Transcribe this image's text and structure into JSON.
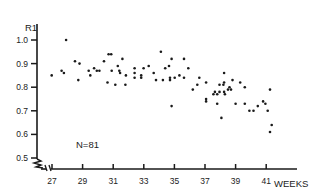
{
  "chart_data": {
    "type": "scatter",
    "title": "",
    "xlabel": "WEEKS",
    "ylabel": "R1",
    "annotation": "N=81",
    "xlim": [
      26.5,
      42.5
    ],
    "ylim": [
      0.5,
      1.0
    ],
    "x_ticks": [
      27,
      29,
      31,
      33,
      35,
      37,
      39,
      41
    ],
    "y_ticks": [
      0.5,
      0.6,
      0.7,
      0.8,
      0.9,
      1.0
    ],
    "y_tick_labels": [
      "0.5",
      "0.6",
      "0.7",
      "0.8",
      "0.9",
      "1.0"
    ],
    "grid": false,
    "axis_break": true,
    "colors": {
      "ink": "#1a1a1a",
      "background": "#ffffff"
    },
    "points": [
      [
        26.98,
        0.85
      ],
      [
        27.63,
        0.87
      ],
      [
        27.78,
        0.86
      ],
      [
        27.92,
        1.0
      ],
      [
        28.5,
        0.91
      ],
      [
        28.8,
        0.9
      ],
      [
        28.72,
        0.83
      ],
      [
        29.4,
        0.87
      ],
      [
        29.5,
        0.85
      ],
      [
        29.75,
        0.88
      ],
      [
        29.93,
        0.87
      ],
      [
        30.1,
        0.87
      ],
      [
        30.4,
        0.91
      ],
      [
        30.63,
        0.82
      ],
      [
        30.7,
        0.94
      ],
      [
        30.87,
        0.94
      ],
      [
        30.9,
        0.87
      ],
      [
        31.14,
        0.81
      ],
      [
        31.3,
        0.89
      ],
      [
        31.4,
        0.87
      ],
      [
        31.45,
        0.86
      ],
      [
        31.6,
        0.92
      ],
      [
        31.8,
        0.81
      ],
      [
        31.83,
        0.85
      ],
      [
        32.4,
        0.88
      ],
      [
        32.4,
        0.86
      ],
      [
        32.4,
        0.84
      ],
      [
        32.83,
        0.85
      ],
      [
        32.83,
        0.84
      ],
      [
        32.99,
        0.88
      ],
      [
        33.32,
        0.89
      ],
      [
        33.65,
        0.86
      ],
      [
        33.8,
        0.83
      ],
      [
        34.12,
        0.95
      ],
      [
        34.25,
        0.83
      ],
      [
        34.4,
        0.88
      ],
      [
        34.65,
        0.89
      ],
      [
        34.71,
        0.84
      ],
      [
        34.71,
        0.83
      ],
      [
        34.82,
        0.92
      ],
      [
        34.82,
        0.72
      ],
      [
        35.02,
        0.84
      ],
      [
        35.33,
        0.85
      ],
      [
        35.63,
        0.92
      ],
      [
        35.63,
        0.84
      ],
      [
        35.91,
        0.88
      ],
      [
        36.2,
        0.79
      ],
      [
        36.5,
        0.81
      ],
      [
        36.63,
        0.84
      ],
      [
        37.07,
        0.82
      ],
      [
        37.07,
        0.75
      ],
      [
        37.07,
        0.74
      ],
      [
        37.55,
        0.77
      ],
      [
        37.65,
        0.78
      ],
      [
        37.8,
        0.77
      ],
      [
        37.8,
        0.73
      ],
      [
        37.95,
        0.81
      ],
      [
        37.95,
        0.78
      ],
      [
        38.07,
        0.67
      ],
      [
        38.2,
        0.81
      ],
      [
        38.25,
        0.86
      ],
      [
        38.25,
        0.82
      ],
      [
        38.25,
        0.78
      ],
      [
        38.3,
        0.77
      ],
      [
        38.5,
        0.79
      ],
      [
        38.6,
        0.8
      ],
      [
        38.7,
        0.79
      ],
      [
        38.8,
        0.83
      ],
      [
        39.0,
        0.73
      ],
      [
        39.3,
        0.82
      ],
      [
        39.6,
        0.8
      ],
      [
        39.6,
        0.73
      ],
      [
        39.9,
        0.7
      ],
      [
        40.17,
        0.7
      ],
      [
        40.45,
        0.72
      ],
      [
        40.95,
        0.73
      ],
      [
        41.1,
        0.7
      ],
      [
        41.25,
        0.79
      ],
      [
        41.25,
        0.61
      ],
      [
        41.36,
        0.64
      ],
      [
        40.8,
        0.74
      ]
    ]
  }
}
